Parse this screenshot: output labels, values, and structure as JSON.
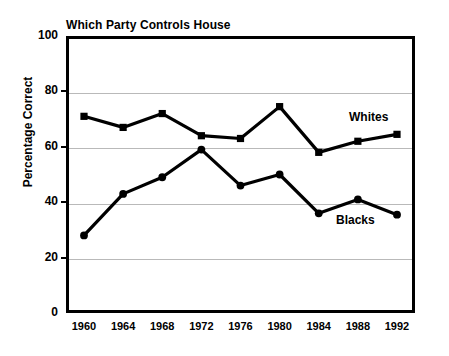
{
  "chart_data": {
    "type": "line",
    "title": "Which Party Controls House",
    "xlabel": "",
    "ylabel": "Percentage Correct",
    "categories": [
      "1960",
      "1964",
      "1968",
      "1972",
      "1976",
      "1980",
      "1984",
      "1988",
      "1992"
    ],
    "x": [
      1960,
      1964,
      1968,
      1972,
      1976,
      1980,
      1984,
      1988,
      1992
    ],
    "series": [
      {
        "name": "Whites",
        "values": [
          71,
          67,
          72,
          64,
          63,
          74.5,
          58,
          62,
          64.5
        ],
        "marker": "square",
        "color": "#000000"
      },
      {
        "name": "Blacks",
        "values": [
          28,
          43,
          49,
          59,
          46,
          50,
          36,
          41,
          35.5
        ],
        "marker": "circle",
        "color": "#000000"
      }
    ],
    "ylim": [
      0,
      100
    ],
    "yticks": [
      0,
      20,
      40,
      60,
      80,
      100
    ],
    "ytick_labels": [
      "0",
      "20",
      "40",
      "60",
      "80",
      "100"
    ],
    "grid": true,
    "grid_color": "#b9b9b9",
    "legend": "inline-labels",
    "annotations": [
      {
        "text": "Whites",
        "series": "Whites",
        "near_x": "1988"
      },
      {
        "text": "Blacks",
        "series": "Blacks",
        "near_x": "1986"
      }
    ],
    "axis_color": "#000000",
    "background": "#ffffff"
  }
}
